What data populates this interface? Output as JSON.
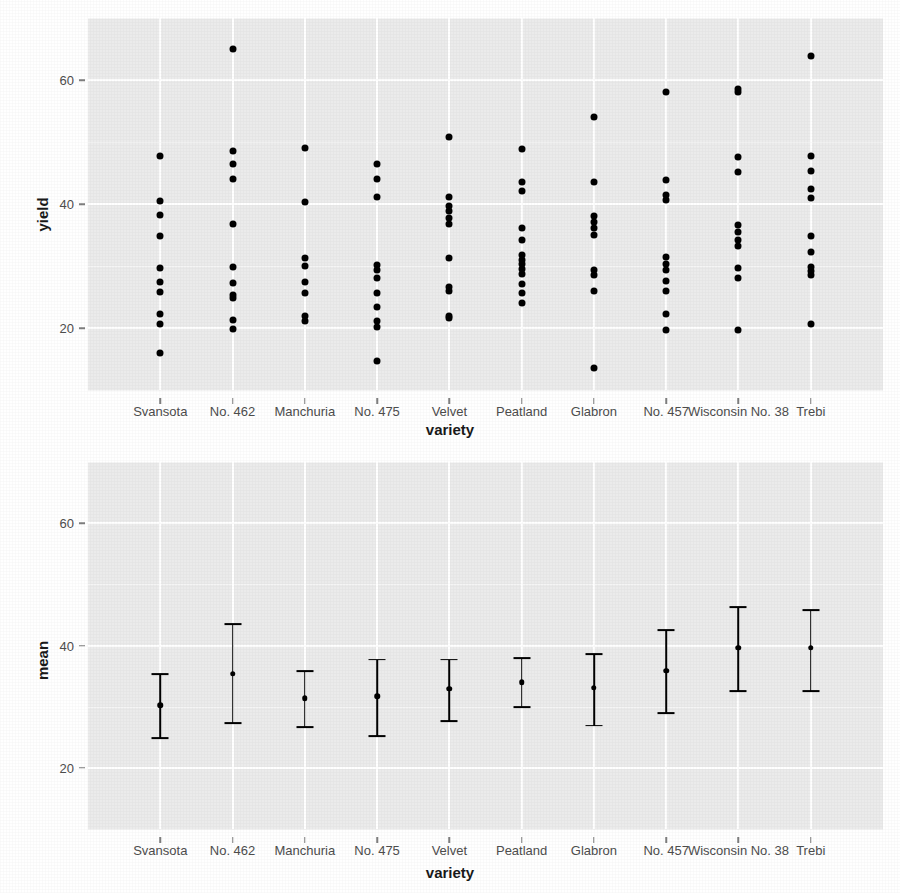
{
  "figure": {
    "background_color": "#ffffff",
    "panel_background_color": "#ebebeb",
    "grid_color": "#ffffff",
    "mark_color": "#000000",
    "axis_text_color": "#4d4d4d",
    "axis_title_color": "#1a1a1a"
  },
  "chart_data": [
    {
      "id": "yield-panel",
      "type": "scatter",
      "title": "",
      "xlabel": "variety",
      "ylabel": "yield",
      "xlim": [
        0,
        11
      ],
      "ylim": [
        10,
        70
      ],
      "yticks": [
        20,
        40,
        60
      ],
      "ytick_labels": [
        "20",
        "40",
        "60"
      ],
      "grid": true,
      "legend": "none",
      "categories": [
        "Svansota",
        "No. 462",
        "Manchuria",
        "No. 475",
        "Velvet",
        "Peatland",
        "Glabron",
        "No. 457",
        "Wisconsin No. 38",
        "Trebi"
      ],
      "series": [
        {
          "name": "Svansota",
          "values": [
            47.8,
            40.5,
            38.3,
            34.8,
            29.6,
            27.4,
            25.8,
            22.2,
            20.6,
            15.9
          ]
        },
        {
          "name": "No. 462",
          "values": [
            65.0,
            48.6,
            46.4,
            44.1,
            36.8,
            29.9,
            27.2,
            25.4,
            24.8,
            21.3,
            19.8
          ]
        },
        {
          "name": "Manchuria",
          "values": [
            49.1,
            40.4,
            31.3,
            30.0,
            27.4,
            25.6,
            22.0,
            21.1
          ]
        },
        {
          "name": "No. 475",
          "values": [
            46.5,
            44.1,
            41.2,
            30.2,
            29.3,
            28.0,
            25.7,
            23.4,
            21.2,
            20.1,
            14.7
          ]
        },
        {
          "name": "Velvet",
          "values": [
            50.8,
            41.1,
            39.7,
            38.8,
            37.8,
            36.7,
            31.3,
            26.6,
            25.9,
            22.0,
            21.6
          ]
        },
        {
          "name": "Peatland",
          "values": [
            48.8,
            43.6,
            42.1,
            36.1,
            34.2,
            31.8,
            31.0,
            30.4,
            29.5,
            28.7,
            27.1,
            25.7,
            24.1
          ]
        },
        {
          "name": "Glabron",
          "values": [
            54.1,
            43.5,
            38.1,
            37.1,
            36.2,
            35.0,
            29.3,
            28.5,
            25.9,
            13.6
          ]
        },
        {
          "name": "No. 457",
          "values": [
            58.1,
            43.8,
            41.5,
            40.6,
            31.5,
            30.4,
            29.4,
            27.6,
            26.0,
            22.2,
            19.6
          ]
        },
        {
          "name": "Wisconsin No. 38",
          "values": [
            58.6,
            58.0,
            47.6,
            45.1,
            36.6,
            35.5,
            34.2,
            33.2,
            29.6,
            28.1,
            19.6
          ]
        },
        {
          "name": "Trebi",
          "values": [
            63.8,
            47.7,
            45.3,
            42.4,
            41.0,
            34.9,
            32.3,
            29.8,
            29.2,
            28.6,
            20.6
          ]
        }
      ]
    },
    {
      "id": "mean-panel",
      "type": "line",
      "plot_style": "point-with-error-bars",
      "title": "",
      "xlabel": "variety",
      "ylabel": "mean",
      "xlim": [
        0,
        11
      ],
      "ylim": [
        10,
        70
      ],
      "yticks": [
        20,
        40,
        60
      ],
      "ytick_labels": [
        "20",
        "40",
        "60"
      ],
      "grid": true,
      "legend": "none",
      "categories": [
        "Svansota",
        "No. 462",
        "Manchuria",
        "No. 475",
        "Velvet",
        "Peatland",
        "Glabron",
        "No. 457",
        "Wisconsin No. 38",
        "Trebi"
      ],
      "points": [
        {
          "category": "Svansota",
          "mean": 30.2,
          "lower": 24.9,
          "upper": 35.3
        },
        {
          "category": "No. 462",
          "mean": 35.4,
          "lower": 27.3,
          "upper": 43.5
        },
        {
          "category": "Manchuria",
          "mean": 31.4,
          "lower": 26.7,
          "upper": 35.8
        },
        {
          "category": "No. 475",
          "mean": 31.7,
          "lower": 25.2,
          "upper": 37.7
        },
        {
          "category": "Velvet",
          "mean": 32.9,
          "lower": 27.7,
          "upper": 37.7
        },
        {
          "category": "Peatland",
          "mean": 34.0,
          "lower": 29.9,
          "upper": 38.0
        },
        {
          "category": "Glabron",
          "mean": 33.1,
          "lower": 26.9,
          "upper": 38.6
        },
        {
          "category": "No. 457",
          "mean": 35.9,
          "lower": 29.0,
          "upper": 42.5
        },
        {
          "category": "Wisconsin No. 38",
          "mean": 39.6,
          "lower": 32.5,
          "upper": 46.3
        },
        {
          "category": "Trebi",
          "mean": 39.6,
          "lower": 32.6,
          "upper": 45.8
        }
      ]
    }
  ]
}
